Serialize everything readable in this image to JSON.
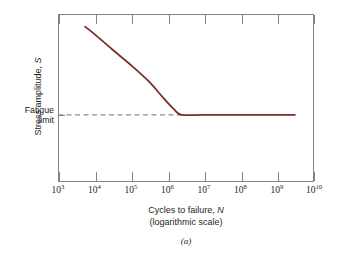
{
  "figure": {
    "caption": "(a)",
    "background_color": "#ffffff"
  },
  "chart_data": {
    "type": "line",
    "title": "",
    "xlabel": "Cycles to failure, N",
    "xlabel_sub": "(logarithmic scale)",
    "ylabel": "Stress amplitude, S",
    "xscale": "log",
    "yscale": "linear",
    "xlim": [
      1000,
      10000000000
    ],
    "ylim": [
      0,
      1
    ],
    "grid": false,
    "legend": null,
    "x_tick_labels": [
      "10³",
      "10⁴",
      "10⁵",
      "10⁶",
      "10⁷",
      "10⁸",
      "10⁹",
      "10¹⁰"
    ],
    "x_tick_mantissa": [
      "10",
      "10",
      "10",
      "10",
      "10",
      "10",
      "10",
      "10"
    ],
    "x_tick_exponents": [
      "3",
      "4",
      "5",
      "6",
      "7",
      "8",
      "9",
      "10"
    ],
    "y_tick_labels": [],
    "annotations": [
      {
        "name": "fatigue-limit",
        "text_line1": "Fatigue",
        "text_line2": "limit",
        "value_y": 0.4,
        "line_style": "dashed",
        "line_color": "#8c8c8c"
      }
    ],
    "series": [
      {
        "name": "S-N curve",
        "color": "#7a3028",
        "linewidth": 1.8,
        "points": [
          {
            "x": 5500.0,
            "y": 0.925
          },
          {
            "x": 10000.0,
            "y": 0.88
          },
          {
            "x": 30000.0,
            "y": 0.79
          },
          {
            "x": 100000.0,
            "y": 0.695
          },
          {
            "x": 300000.0,
            "y": 0.6
          },
          {
            "x": 800000.0,
            "y": 0.495
          },
          {
            "x": 1500000.0,
            "y": 0.432
          },
          {
            "x": 2400000.0,
            "y": 0.4
          },
          {
            "x": 10000000.0,
            "y": 0.4
          },
          {
            "x": 100000000.0,
            "y": 0.4
          },
          {
            "x": 1000000000.0,
            "y": 0.4
          },
          {
            "x": 3000000000.0,
            "y": 0.4
          }
        ]
      }
    ]
  },
  "axes": {
    "frame_color": "#808285",
    "tick_color": "#808285",
    "tick_length_px": 9
  }
}
